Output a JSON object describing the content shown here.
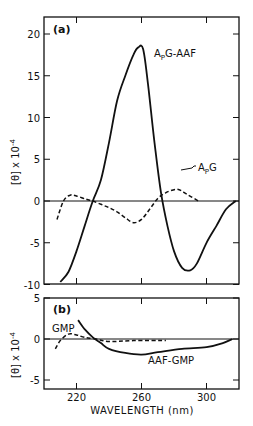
{
  "chart_data": [
    {
      "type": "line",
      "panel_label": "(a)",
      "title": "",
      "xlabel": "WAVELENGTH (nm)",
      "ylabel": "[θ] x 10^-4",
      "xlim": [
        200,
        320
      ],
      "ylim": [
        -10,
        22
      ],
      "yticks": [
        20,
        15,
        10,
        5,
        0,
        -5,
        -10
      ],
      "xticks": [
        220,
        260,
        300
      ],
      "series": [
        {
          "name": "ApG-AAF",
          "style": "solid",
          "x": [
            210,
            215,
            220,
            225,
            230,
            235,
            240,
            245,
            250,
            255,
            258,
            261,
            264,
            268,
            272,
            276,
            280,
            285,
            290,
            294,
            300,
            306,
            312,
            318
          ],
          "values": [
            -9.7,
            -8.5,
            -6,
            -3,
            0,
            2.5,
            7,
            12,
            15,
            17.5,
            18.4,
            18.2,
            14,
            7,
            1,
            -3,
            -6,
            -8,
            -8.3,
            -7.5,
            -5,
            -3,
            -1,
            0
          ]
        },
        {
          "name": "ApG",
          "style": "dashed",
          "x": [
            208,
            212,
            216,
            220,
            226,
            230,
            235,
            240,
            245,
            250,
            255,
            260,
            265,
            270,
            275,
            282,
            288,
            295
          ],
          "values": [
            -2.2,
            0,
            0.7,
            0.6,
            0.2,
            0,
            -0.4,
            -0.8,
            -1.3,
            -2,
            -2.6,
            -2.2,
            -1,
            0.3,
            1,
            1.4,
            0.8,
            0
          ]
        }
      ]
    },
    {
      "type": "line",
      "panel_label": "(b)",
      "title": "",
      "xlabel": "WAVELENGTH (nm)",
      "ylabel": "[θ] x 10^-4",
      "xlim": [
        200,
        320
      ],
      "ylim": [
        -5,
        5
      ],
      "yticks": [
        5,
        0,
        -5
      ],
      "xticks": [
        220,
        260,
        300
      ],
      "series": [
        {
          "name": "GMP",
          "style": "dashed",
          "x": [
            207,
            210,
            215,
            220,
            225,
            232,
            240,
            255,
            275
          ],
          "values": [
            -1.2,
            -0.2,
            0.6,
            0.5,
            0.2,
            0,
            -0.3,
            -0.2,
            -0.2
          ]
        },
        {
          "name": "AAF-GMP",
          "style": "solid",
          "x": [
            221,
            225,
            230,
            235,
            240,
            250,
            260,
            270,
            285,
            300,
            310,
            316
          ],
          "values": [
            2.3,
            1.2,
            0.2,
            -0.5,
            -1.2,
            -1.7,
            -1.9,
            -1.6,
            -1.2,
            -1.0,
            -0.5,
            0
          ]
        }
      ]
    }
  ],
  "labels": {
    "panel_a": "(a)",
    "panel_b": "(b)",
    "ylabel": "[θ] x 10",
    "ylabel_exp": "-4",
    "xlabel": "WAVELENGTH (nm)",
    "series_apg_aaf_main": "A",
    "series_apg_aaf_sub": "P",
    "series_apg_aaf_rest": "G-AAF",
    "series_apg_main": "A",
    "series_apg_sub": "P",
    "series_apg_rest": "G",
    "series_gmp": "GMP",
    "series_aaf_gmp": "AAF-GMP"
  }
}
